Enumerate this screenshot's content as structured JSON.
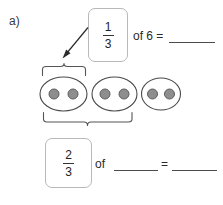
{
  "worksheet": {
    "item_label": "a)",
    "background_color": "#ffffff"
  },
  "top_equation": {
    "fraction": {
      "numerator": "1",
      "denominator": "3"
    },
    "text": "of 6 =",
    "blank_answer": ""
  },
  "bottom_equation": {
    "fraction": {
      "numerator": "2",
      "denominator": "3"
    },
    "text_of": "of",
    "text_equals": "=",
    "blank_whole": "",
    "blank_answer": ""
  },
  "model": {
    "group_count": 3,
    "dots_per_group": 2,
    "total_dots": 6,
    "groups": [
      {
        "label": "group-1",
        "dots": 2,
        "selected": true
      },
      {
        "label": "group-2",
        "dots": 2,
        "selected": true
      },
      {
        "label": "group-3",
        "dots": 2,
        "selected": false
      }
    ],
    "top_brace": {
      "covers_groups": 1,
      "points_to": "one-third-fraction-box"
    },
    "bottom_brace": {
      "covers_groups": 2,
      "points_to": "two-thirds-fraction-box"
    },
    "oval_stroke_color": "#4a4a4a",
    "dot_fill_color": "#8e8e8e",
    "dot_stroke_color": "#5d5d5d",
    "brace_color": "#555555",
    "arrow_color": "#2b2b2b"
  }
}
